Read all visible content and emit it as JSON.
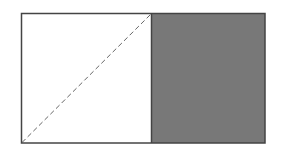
{
  "diagram": {
    "outer_rect": {
      "x": 21,
      "y": 13,
      "width": 244,
      "height": 130
    },
    "divider_x": 151,
    "left_square": {
      "fill": "#ffffff"
    },
    "right_square": {
      "fill": "#787878"
    },
    "diagonal": {
      "from": "bottom-left",
      "to": "top-right",
      "style": "dashed",
      "color": "#666666"
    },
    "stroke_color": "#444444"
  }
}
